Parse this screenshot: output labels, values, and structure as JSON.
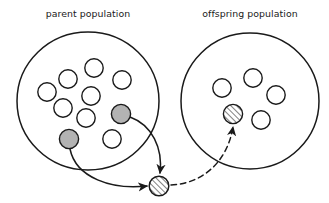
{
  "figure": {
    "background_color": "#ffffff",
    "stroke_color": "#1a1a1a",
    "width": 329,
    "height": 203
  },
  "labels": {
    "parent": "parent population",
    "offspring": "offspring population"
  },
  "populations": [
    {
      "id": "parent",
      "label": "parent population",
      "label_x": 88,
      "label_y": 17,
      "cx": 88,
      "cy": 101,
      "rx": 71,
      "ry": 69,
      "member_count": 10,
      "members": [
        {
          "name": "individual-1",
          "cx": 47,
          "cy": 92,
          "r": 9.2,
          "fill": "none"
        },
        {
          "name": "individual-2",
          "cx": 68,
          "cy": 79,
          "r": 9.2,
          "fill": "none"
        },
        {
          "name": "individual-3",
          "cx": 94,
          "cy": 68,
          "r": 9.2,
          "fill": "none"
        },
        {
          "name": "individual-4",
          "cx": 122,
          "cy": 80,
          "r": 9.2,
          "fill": "none"
        },
        {
          "name": "individual-5",
          "cx": 91,
          "cy": 96,
          "r": 9.2,
          "fill": "none"
        },
        {
          "name": "individual-6",
          "cx": 63,
          "cy": 108,
          "r": 9.2,
          "fill": "none"
        },
        {
          "name": "individual-7",
          "cx": 86,
          "cy": 118,
          "r": 9.2,
          "fill": "none"
        },
        {
          "name": "individual-8",
          "cx": 112,
          "cy": 139,
          "r": 9.2,
          "fill": "none"
        },
        {
          "name": "parent-selected-right",
          "cx": 121,
          "cy": 114,
          "r": 9.6,
          "fill": "#b3b3b3"
        },
        {
          "name": "parent-selected-left",
          "cx": 69,
          "cy": 139,
          "r": 9.6,
          "fill": "#b3b3b3"
        }
      ]
    },
    {
      "id": "offspring",
      "label": "offspring population",
      "label_x": 250,
      "label_y": 17,
      "cx": 250,
      "cy": 101,
      "rx": 69,
      "ry": 68,
      "member_count": 5,
      "members": [
        {
          "name": "individual-1",
          "cx": 222,
          "cy": 88,
          "r": 9.2,
          "fill": "none"
        },
        {
          "name": "individual-2",
          "cx": 253,
          "cy": 78,
          "r": 9.2,
          "fill": "none"
        },
        {
          "name": "individual-3",
          "cx": 276,
          "cy": 95,
          "r": 9.2,
          "fill": "none"
        },
        {
          "name": "individual-4",
          "cx": 261,
          "cy": 120,
          "r": 9.2,
          "fill": "none"
        },
        {
          "name": "offspring-inserted",
          "cx": 233,
          "cy": 114,
          "r": 9.6,
          "fill": "hatch"
        }
      ]
    }
  ],
  "child": {
    "name": "child-individual",
    "cx": 159,
    "cy": 186,
    "r": 9.8,
    "fill": "hatch",
    "hatch_pattern": "diagonal-lines"
  },
  "connections": [
    {
      "name": "recombination-arrow-from-right-parent",
      "style": "solid",
      "path": "M 130 117 C 152 125, 163 148, 160 173",
      "arrow": "down"
    },
    {
      "name": "recombination-arrow-from-left-parent",
      "style": "solid",
      "path": "M 70 149 C 76 178, 112 190, 147 186",
      "arrow": "right"
    },
    {
      "name": "insertion-arrow-to-offspring",
      "style": "dashed",
      "path": "M 171 185 C 200 184, 227 164, 233 127",
      "arrow": "up"
    }
  ]
}
